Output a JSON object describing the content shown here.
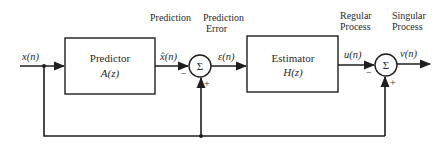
{
  "diagram": {
    "type": "block-diagram",
    "input": {
      "label": "x(n)"
    },
    "blocks": [
      {
        "id": "predictor",
        "title": "Predictor",
        "transfer": "A(z)"
      },
      {
        "id": "estimator",
        "title": "Estimator",
        "transfer": "H(z)"
      }
    ],
    "summers": [
      {
        "id": "sum1",
        "symbol": "Σ",
        "minus": "−",
        "plus": "+"
      },
      {
        "id": "sum2",
        "symbol": "Σ",
        "minus": "−",
        "plus": "+"
      }
    ],
    "signals": {
      "prediction": "x̂(n)",
      "prediction_error": "ε(n)",
      "regular": "u(n)",
      "output": "v(n)"
    },
    "headers": {
      "prediction": "Prediction",
      "prediction_error_line1": "Prediction",
      "prediction_error_line2": "Error",
      "regular_line1": "Regular",
      "regular_line2": "Process",
      "singular_line1": "Singular",
      "singular_line2": "Process"
    },
    "colors": {
      "line": "#1e1e1e",
      "text": "#2a2a2a",
      "background": "#ffffff"
    }
  }
}
